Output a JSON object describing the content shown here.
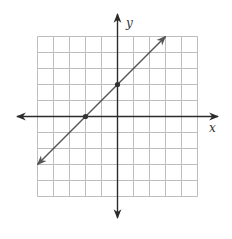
{
  "chart_data": {
    "type": "line",
    "title": "",
    "xlabel": "x",
    "ylabel": "y",
    "xlim": [
      -5,
      5
    ],
    "ylim": [
      -5,
      5
    ],
    "grid": true,
    "tick_labels": false,
    "series": [
      {
        "name": "line",
        "equation": "y = x + 2",
        "slope": 1,
        "intercept": 2,
        "x": [
          -5,
          3
        ],
        "y": [
          -3,
          5
        ],
        "arrows_both_ends": true,
        "marked_points": [
          {
            "x": -2,
            "y": 0
          },
          {
            "x": 0,
            "y": 2
          }
        ]
      }
    ]
  },
  "style": {
    "grid_color": "#bdbdbd",
    "axis_color": "#2b2b2b",
    "line_color": "#555555",
    "point_color": "#333333"
  },
  "labels": {
    "x_axis": "x",
    "y_axis": "y"
  }
}
